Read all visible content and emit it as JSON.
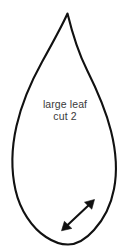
{
  "document": {
    "type": "sewing-pattern-piece",
    "background_color": "#ffffff",
    "width": 130,
    "height": 251
  },
  "pattern_piece": {
    "shape_name": "leaf-teardrop-outline",
    "outline_color": "#111111",
    "fill_color": "#ffffff",
    "stroke_width": 2.1,
    "label": {
      "line1": "large leaf",
      "line2": "cut 2",
      "color": "#3a3a3a",
      "font_size_px": 10.5
    }
  },
  "grain_arrow": {
    "name": "grainline-double-arrow",
    "color": "#111111",
    "direction": "diagonal-lower-left-to-upper-right",
    "start": {
      "x": 62,
      "y": 230
    },
    "end": {
      "x": 94,
      "y": 200
    }
  }
}
